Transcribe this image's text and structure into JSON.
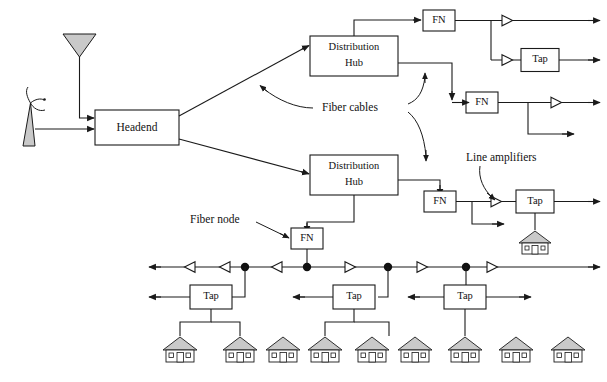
{
  "diagram": {
    "nodes": {
      "headend": "Headend",
      "distribution_hub_upper": "Distribution Hub",
      "distribution_hub_lower": "Distribution Hub",
      "fn_1": "FN",
      "fn_2": "FN",
      "fn_3": "FN",
      "fn_4": "FN",
      "tap_1": "Tap",
      "tap_2": "Tap",
      "tap_3": "Tap",
      "tap_4": "Tap",
      "tap_5": "Tap"
    },
    "annotations": {
      "fiber_cables": "Fiber cables",
      "line_amplifiers": "Line amplifiers",
      "fiber_node": "Fiber node"
    },
    "box_labels": {
      "distribution_line1": "Distribution",
      "distribution_line2": "Hub"
    },
    "colors": {
      "stroke": "#1a1a1a",
      "fill_shape": "#c9c9c9",
      "background": "#ffffff"
    },
    "symbol_counts": {
      "fiber_nodes": 4,
      "taps": 5,
      "houses": 9,
      "line_amplifiers": 9,
      "junction_dots": 4,
      "distribution_hubs": 2,
      "antennas": 2
    }
  }
}
